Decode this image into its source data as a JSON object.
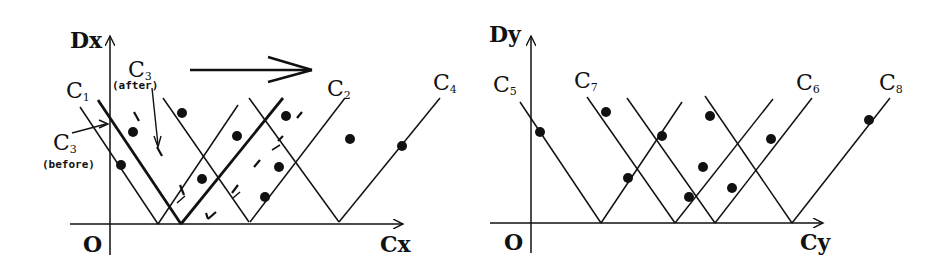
{
  "left_panel": {
    "y_axis_label": "Dx",
    "x_axis_label": "Cx",
    "origin_label": "O",
    "curve_labels": [
      {
        "main": "C",
        "sub": "1"
      },
      {
        "main": "C",
        "sub": "3",
        "note": "(after)"
      },
      {
        "main": "C",
        "sub": "3",
        "note": "(before)"
      },
      {
        "main": "C",
        "sub": "2"
      },
      {
        "main": "C",
        "sub": "4"
      }
    ],
    "shift_arrow": "right-arrow"
  },
  "right_panel": {
    "y_axis_label": "Dy",
    "x_axis_label": "Cy",
    "origin_label": "O",
    "curve_labels": [
      {
        "main": "C",
        "sub": "5"
      },
      {
        "main": "C",
        "sub": "7"
      },
      {
        "main": "C",
        "sub": "6"
      },
      {
        "main": "C",
        "sub": "8"
      }
    ]
  },
  "colors": {
    "ink": "#111111",
    "background": "#ffffff"
  }
}
